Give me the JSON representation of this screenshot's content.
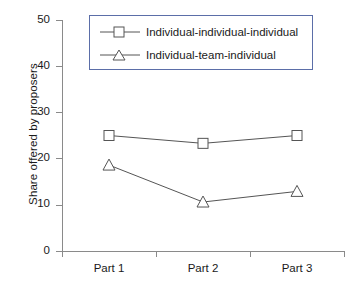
{
  "chart_data": {
    "type": "line",
    "title": "",
    "subtitle": "",
    "xlabel": "",
    "ylabel": "Share offered by proposers",
    "categories": [
      "Part 1",
      "Part 2",
      "Part 3"
    ],
    "ylim": [
      0,
      50
    ],
    "yticks": [
      0,
      10,
      20,
      30,
      40,
      50
    ],
    "ytick_labels": [
      "0",
      "10",
      "20",
      "30",
      "40",
      "50"
    ],
    "grid": false,
    "legend_position": "top-center",
    "series": [
      {
        "name": "Individual-individual-individual",
        "marker": "square",
        "color": "#555555",
        "values": [
          25.0,
          23.3,
          25.0
        ]
      },
      {
        "name": "Individual-team-individual",
        "marker": "triangle",
        "color": "#555555",
        "values": [
          18.6,
          10.6,
          12.9
        ]
      }
    ]
  },
  "axes": {
    "ylabel": "Share offered by proposers",
    "ytick_labels": [
      "50",
      "40",
      "30",
      "20",
      "10",
      "0"
    ],
    "xtick_labels": [
      "Part 1",
      "Part 2",
      "Part 3"
    ]
  },
  "legend": {
    "entries": [
      {
        "label": "Individual-individual-individual",
        "marker": "square-marker-icon"
      },
      {
        "label": "Individual-team-individual",
        "marker": "triangle-marker-icon"
      }
    ]
  },
  "colors": {
    "line": "#555555",
    "axis": "#8a8a8a",
    "legend_border": "#5b6ea8",
    "text": "#1a1a1a",
    "background": "#ffffff"
  }
}
